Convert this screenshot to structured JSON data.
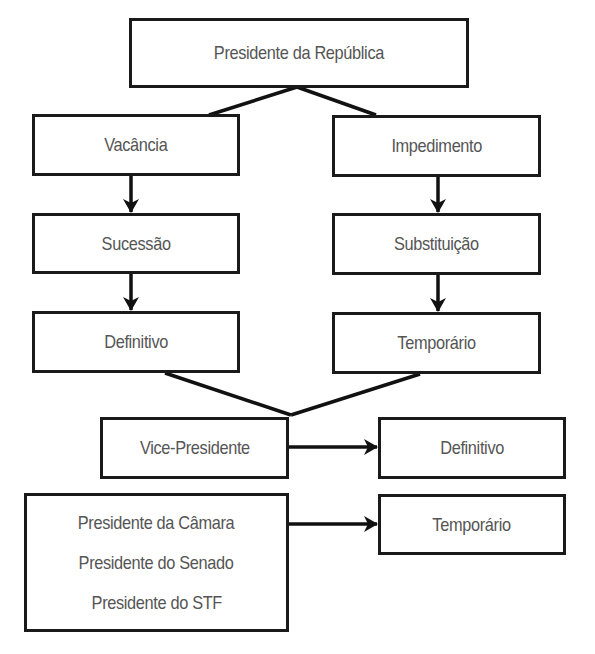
{
  "diagram": {
    "type": "flowchart",
    "colors": {
      "border": "#1a1a1a",
      "text": "#555555",
      "background": "#ffffff"
    },
    "nodes": {
      "root": {
        "label": "Presidente da República"
      },
      "vacancia": {
        "label": "Vacância"
      },
      "impedimento": {
        "label": "Impedimento"
      },
      "sucessao": {
        "label": "Sucessão"
      },
      "substituicao": {
        "label": "Substituição"
      },
      "definitivo_left": {
        "label": "Definitivo"
      },
      "temporario_right": {
        "label": "Temporário"
      },
      "vice": {
        "label": "Vice-Presidente"
      },
      "definitivo_result": {
        "label": "Definitivo"
      },
      "line_of_succession": {
        "lines": [
          "Presidente da Câmara",
          "Presidente do Senado",
          "Presidente do STF"
        ]
      },
      "temporario_result": {
        "label": "Temporário"
      }
    },
    "edges": [
      {
        "from": "Presidente da República",
        "to": "Vacância",
        "style": "line"
      },
      {
        "from": "Presidente da República",
        "to": "Impedimento",
        "style": "line"
      },
      {
        "from": "Vacância",
        "to": "Sucessão",
        "style": "arrow"
      },
      {
        "from": "Impedimento",
        "to": "Substituição",
        "style": "arrow"
      },
      {
        "from": "Sucessão",
        "to": "Definitivo",
        "style": "arrow"
      },
      {
        "from": "Substituição",
        "to": "Temporário",
        "style": "arrow"
      },
      {
        "from": "Definitivo",
        "to": "Vice-Presidente",
        "style": "line"
      },
      {
        "from": "Temporário",
        "to": "Vice-Presidente",
        "style": "line"
      },
      {
        "from": "Vice-Presidente",
        "to": "Definitivo",
        "style": "arrow"
      },
      {
        "from": "Presidente da Câmara / Presidente do Senado / Presidente do STF",
        "to": "Temporário",
        "style": "arrow"
      }
    ]
  }
}
